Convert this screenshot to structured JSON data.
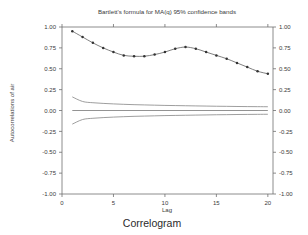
{
  "chart_data": {
    "type": "line",
    "title": "Bartlett's formula for MA(q) 95% confidence bands",
    "caption": "Correlogram",
    "xlabel": "Lag",
    "ylabel": "Autocorrelations of air",
    "xlim": [
      0,
      20.5
    ],
    "ylim": [
      -1.0,
      1.0
    ],
    "xticks": [
      0,
      5,
      10,
      15,
      20
    ],
    "xtick_labels": [
      "0",
      "5",
      "10",
      "15",
      "20"
    ],
    "yticks": [
      1.0,
      0.75,
      0.5,
      0.25,
      0.0,
      -0.25,
      -0.5,
      -0.75,
      -1.0
    ],
    "ytick_labels": [
      "1.00",
      "0.75",
      "0.50",
      "0.25",
      "0.00",
      "-0.25",
      "-0.50",
      "-0.75",
      "-1.00"
    ],
    "grid": false,
    "legend": false,
    "left_axis_labels": true,
    "right_axis_labels": true,
    "top_axis_ticks": true,
    "x": [
      1,
      2,
      3,
      4,
      5,
      6,
      7,
      8,
      9,
      10,
      11,
      12,
      13,
      14,
      15,
      16,
      17,
      18,
      19,
      20
    ],
    "series": [
      {
        "name": "Autocorrelations of air",
        "marker": "circle",
        "values": [
          0.95,
          0.88,
          0.81,
          0.75,
          0.7,
          0.66,
          0.65,
          0.65,
          0.67,
          0.7,
          0.74,
          0.76,
          0.74,
          0.7,
          0.66,
          0.62,
          0.57,
          0.52,
          0.47,
          0.44
        ]
      },
      {
        "name": "Bartlett upper 95% band",
        "marker": "none",
        "values": [
          0.163,
          0.108,
          0.093,
          0.085,
          0.079,
          0.074,
          0.07,
          0.067,
          0.064,
          0.061,
          0.059,
          0.057,
          0.055,
          0.053,
          0.051,
          0.05,
          0.048,
          0.047,
          0.046,
          0.045
        ]
      },
      {
        "name": "Bartlett lower 95% band",
        "marker": "none",
        "values": [
          -0.163,
          -0.108,
          -0.093,
          -0.085,
          -0.079,
          -0.074,
          -0.07,
          -0.067,
          -0.064,
          -0.061,
          -0.059,
          -0.057,
          -0.055,
          -0.053,
          -0.051,
          -0.05,
          -0.048,
          -0.047,
          -0.046,
          -0.045
        ]
      },
      {
        "name": "Zero reference line",
        "marker": "none",
        "values": [
          0,
          0,
          0,
          0,
          0,
          0,
          0,
          0,
          0,
          0,
          0,
          0,
          0,
          0,
          0,
          0,
          0,
          0,
          0,
          0
        ]
      }
    ],
    "colors": {
      "axis": "#6e6e6e",
      "autocorrelation": "#555555",
      "marker": "#333333",
      "band": "#8d8d8d",
      "background": "#ffffff"
    }
  }
}
